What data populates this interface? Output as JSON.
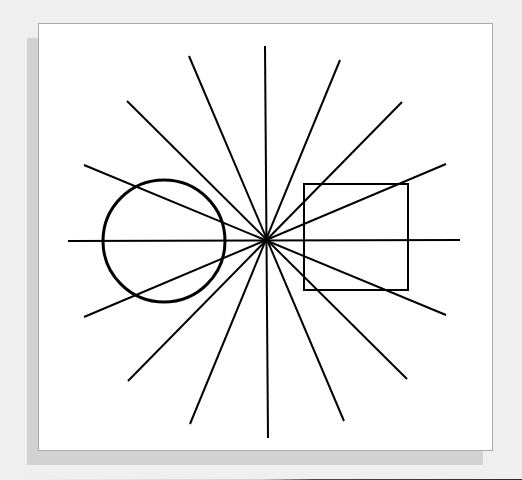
{
  "figure": {
    "type": "optical-illusion",
    "background_color": "#efefef",
    "panel_color": "#ffffff",
    "shadow_color": "#d2d2d2",
    "stroke_color": "#000000",
    "center": {
      "x": 265,
      "y": 240
    },
    "rays": [
      {
        "x1": 264,
        "y1": 45,
        "x2": 267,
        "y2": 437
      },
      {
        "x1": 67,
        "y1": 240,
        "x2": 459,
        "y2": 239
      },
      {
        "x1": 188,
        "y1": 55,
        "x2": 343,
        "y2": 420
      },
      {
        "x1": 339,
        "y1": 59,
        "x2": 189,
        "y2": 423
      },
      {
        "x1": 126,
        "y1": 100,
        "x2": 406,
        "y2": 378
      },
      {
        "x1": 401,
        "y1": 101,
        "x2": 127,
        "y2": 380
      },
      {
        "x1": 83,
        "y1": 164,
        "x2": 445,
        "y2": 314
      },
      {
        "x1": 445,
        "y1": 163,
        "x2": 83,
        "y2": 316
      }
    ],
    "circle": {
      "cx": 163,
      "cy": 240,
      "r": 61,
      "stroke_width": 3
    },
    "square": {
      "x": 303,
      "y": 183,
      "width": 104,
      "height": 106,
      "stroke_width": 2
    }
  }
}
